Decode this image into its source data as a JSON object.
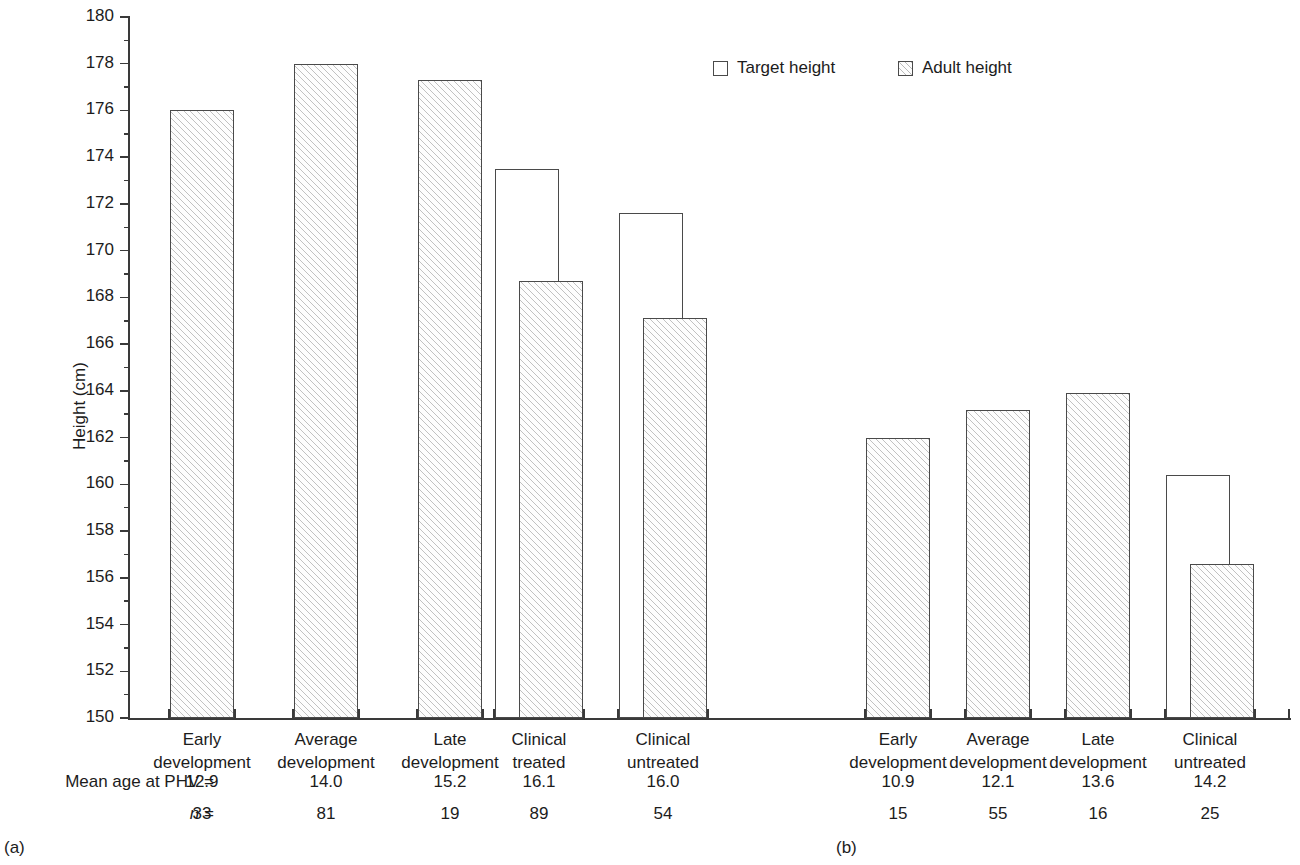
{
  "chart_data": {
    "type": "bar",
    "title": "",
    "xlabel": "",
    "ylabel": "Height (cm)",
    "ylim": [
      150,
      180
    ],
    "ytick_step": 2,
    "ytick_labels": [
      "180",
      "178",
      "176",
      "174",
      "172",
      "170",
      "168",
      "166",
      "164",
      "162",
      "160",
      "158",
      "156",
      "154",
      "152",
      "150"
    ],
    "grid": false,
    "legend_position": "top-right",
    "legend": [
      "Target height",
      "Adult height"
    ],
    "panels": [
      {
        "tag": "(a)",
        "categories": [
          {
            "line1": "Early",
            "line2": "development",
            "target": null,
            "adult": 176.0,
            "mean_age_phv": "12.9",
            "n": "33"
          },
          {
            "line1": "Average",
            "line2": "development",
            "target": null,
            "adult": 178.0,
            "mean_age_phv": "14.0",
            "n": "81"
          },
          {
            "line1": "Late",
            "line2": "development",
            "target": null,
            "adult": 177.3,
            "mean_age_phv": "15.2",
            "n": "19"
          },
          {
            "line1": "Clinical",
            "line2": "treated",
            "target": 173.5,
            "adult": 168.7,
            "mean_age_phv": "16.1",
            "n": "89"
          },
          {
            "line1": "Clinical",
            "line2": "untreated",
            "target": 171.6,
            "adult": 167.1,
            "mean_age_phv": "16.0",
            "n": "54"
          }
        ]
      },
      {
        "tag": "(b)",
        "categories": [
          {
            "line1": "Early",
            "line2": "development",
            "target": null,
            "adult": 162.0,
            "mean_age_phv": "10.9",
            "n": "15"
          },
          {
            "line1": "Average",
            "line2": "development",
            "target": null,
            "adult": 163.2,
            "mean_age_phv": "12.1",
            "n": "55"
          },
          {
            "line1": "Late",
            "line2": "development",
            "target": null,
            "adult": 163.9,
            "mean_age_phv": "13.6",
            "n": "16"
          },
          {
            "line1": "Clinical",
            "line2": "untreated",
            "target": 160.4,
            "adult": 156.6,
            "mean_age_phv": "14.2",
            "n": "25"
          }
        ]
      }
    ],
    "row_labels": {
      "mean_age": "Mean age at PHV",
      "mean_age_eq": "=",
      "n_symbol": "n",
      "n_eq": "="
    },
    "colors": {
      "axis": "#3a3a3a",
      "bar_outline": "#4a4a4a",
      "hatch": "#787878",
      "text": "#1c1c1c",
      "background": "#ffffff"
    }
  }
}
